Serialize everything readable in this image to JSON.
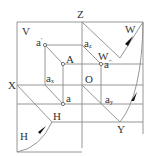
{
  "diagram": {
    "type": "three-plane orthographic projection",
    "colors": {
      "line": "#8a8a8a",
      "text": "#333333",
      "arrow": "#111111",
      "background": "#ffffff"
    },
    "labels": {
      "V": "V",
      "Z": "Z",
      "W_top": "W",
      "a_prime": "a'",
      "a_z": "aZ",
      "A": "A",
      "W_inner": "W",
      "a_double_prime": "a\"",
      "X": "X",
      "a_x": "aX",
      "O": "O",
      "a": "a",
      "a_y": "aY",
      "H_inner": "H",
      "H_bottom": "H",
      "Y": "Y"
    },
    "label_parts": {
      "a_z_base": "a",
      "a_z_sub": "z",
      "a_x_base": "a",
      "a_x_sub": "x",
      "a_y_base": "a",
      "a_y_sub": "y",
      "a_prime_base": "a",
      "a_prime_mark": "'",
      "a_dp_base": "a",
      "a_dp_mark": "\""
    },
    "planes": [
      "V",
      "H",
      "W"
    ],
    "axes": [
      "X",
      "Y",
      "Z"
    ],
    "origin": "O",
    "point": "A",
    "projections": [
      "a",
      "a'",
      "a\""
    ]
  }
}
